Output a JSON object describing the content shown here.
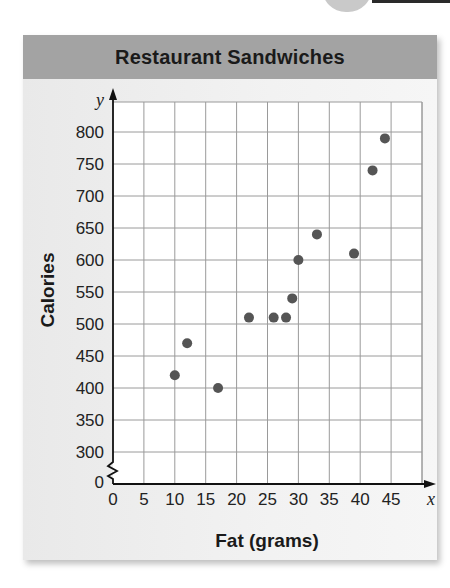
{
  "title": "Restaurant Sandwiches",
  "x_axis": {
    "label": "Fat (grams)",
    "var": "x",
    "ticks": [
      "0",
      "5",
      "10",
      "15",
      "20",
      "25",
      "30",
      "35",
      "40",
      "45"
    ]
  },
  "y_axis": {
    "label": "Calories",
    "var": "y",
    "ticks": [
      "0",
      "300",
      "350",
      "400",
      "450",
      "500",
      "550",
      "600",
      "650",
      "700",
      "750",
      "800"
    ],
    "break": "axis break between 0 and 300"
  },
  "colors": {
    "title_bar": "#a3a3a3",
    "point": "#555555",
    "grid": "#9a9a9a",
    "axis": "#111111"
  },
  "chart_data": {
    "type": "scatter",
    "title": "Restaurant Sandwiches",
    "xlabel": "Fat (grams)",
    "ylabel": "Calories",
    "xlim": [
      0,
      47
    ],
    "ylim": [
      300,
      820
    ],
    "x_ticks": [
      0,
      5,
      10,
      15,
      20,
      25,
      30,
      35,
      40,
      45
    ],
    "y_ticks": [
      0,
      300,
      350,
      400,
      450,
      500,
      550,
      600,
      650,
      700,
      750,
      800
    ],
    "grid": true,
    "legend": null,
    "axis_break": "y axis broken between 0 and 300",
    "series": [
      {
        "name": "Sandwiches",
        "points": [
          {
            "x": 10,
            "y": 420
          },
          {
            "x": 12,
            "y": 470
          },
          {
            "x": 17,
            "y": 400
          },
          {
            "x": 22,
            "y": 510
          },
          {
            "x": 26,
            "y": 510
          },
          {
            "x": 28,
            "y": 510
          },
          {
            "x": 29,
            "y": 540
          },
          {
            "x": 30,
            "y": 600
          },
          {
            "x": 33,
            "y": 640
          },
          {
            "x": 39,
            "y": 610
          },
          {
            "x": 42,
            "y": 740
          },
          {
            "x": 44,
            "y": 790
          }
        ]
      }
    ]
  }
}
